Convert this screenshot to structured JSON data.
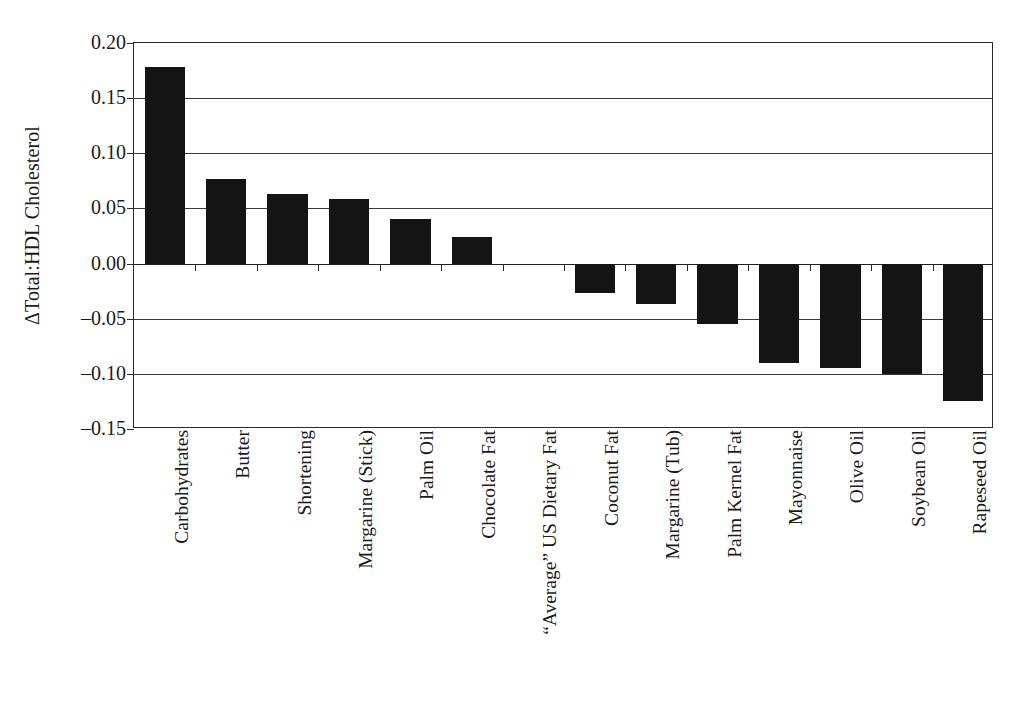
{
  "chart_data": {
    "type": "bar",
    "title": "",
    "xlabel": "",
    "ylabel": "ΔTotal:HDL Cholesterol",
    "ylim": [
      -0.15,
      0.2
    ],
    "ytick_step": 0.05,
    "grid": true,
    "legend": "none",
    "orientation": "vertical",
    "bar_color": "#141414",
    "categories": [
      "Carbohydrates",
      "Butter",
      "Shortening",
      "Margarine (Stick)",
      "Palm Oil",
      "Chocolate Fat",
      "“Average” US Dietary Fat",
      "Coconut Fat",
      "Margarine (Tub)",
      "Palm Kernel Fat",
      "Mayonnaise",
      "Olive Oil",
      "Soybean Oil",
      "Rapeseed Oil"
    ],
    "values": [
      0.178,
      0.077,
      0.063,
      0.059,
      0.04,
      0.024,
      0.0,
      -0.027,
      -0.037,
      -0.055,
      -0.09,
      -0.095,
      -0.1,
      -0.125
    ],
    "ytick_labels": [
      "0.20",
      "0.15",
      "0.10",
      "0.05",
      "0.00",
      "–0.05",
      "–0.10",
      "–0.15"
    ],
    "ytick_values": [
      0.2,
      0.15,
      0.1,
      0.05,
      0.0,
      -0.05,
      -0.1,
      -0.15
    ]
  }
}
